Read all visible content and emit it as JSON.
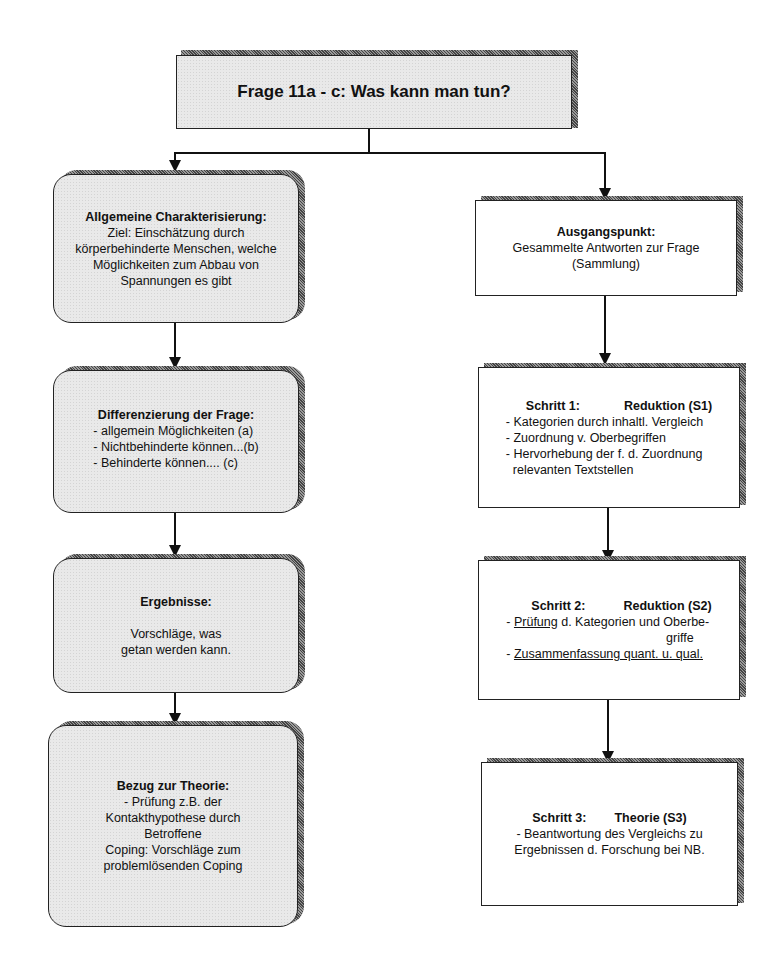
{
  "title_box": {
    "label": "Frage 11a - c: Was kann man tun?"
  },
  "left_column": [
    {
      "heading": "Allgemeine Charakterisierung:",
      "lines": [
        "Ziel: Einschätzung durch",
        "körperbehinderte Menschen, welche",
        "Möglichkeiten zum Abbau von",
        "Spannungen es gibt"
      ]
    },
    {
      "heading": "Differenzierung der Frage:",
      "lines": [
        "- allgemein Möglichkeiten (a)",
        "- Nichtbehinderte können...(b)",
        "- Behinderte können.... (c)"
      ]
    },
    {
      "heading": "Ergebnisse:",
      "lines": [
        "Vorschläge, was",
        "getan werden kann."
      ]
    },
    {
      "heading": "Bezug zur Theorie:",
      "lines": [
        "- Prüfung z.B. der",
        "Kontakthypothese durch",
        "Betroffene",
        "Coping:  Vorschläge zum",
        "problemlösenden Coping"
      ]
    }
  ],
  "right_column": [
    {
      "heading": "Ausgangspunkt:",
      "lines": [
        "Gesammelte Antworten zur Frage",
        "(Sammlung)"
      ]
    },
    {
      "heading_step": "Schritt 1:",
      "heading_name": "Reduktion (S1)",
      "lines": [
        "- Kategorien durch inhaltl. Vergleich",
        "- Zuordnung v. Oberbegriffen",
        "- Hervorhebung der f. d. Zuordnung",
        "relevanten Textstellen"
      ]
    },
    {
      "heading_step": "Schritt 2:",
      "heading_name": "Reduktion (S2)",
      "line1_prefix": "- ",
      "line1_underlined": "Prüfung",
      "line1_rest": " d. Kategorien und Oberbe-",
      "line2": "griffe",
      "line3_prefix": "- ",
      "line3_underlined": "Zusammenfassung quant. u. qual."
    },
    {
      "heading_step": "Schritt 3:",
      "heading_name": "Theorie (S3)",
      "lines": [
        "- Beantwortung des Vergleichs zu",
        "Ergebnissen d. Forschung bei NB."
      ]
    }
  ]
}
